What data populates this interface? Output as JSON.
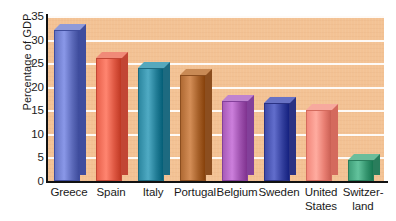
{
  "chart_data": {
    "type": "bar",
    "title": "",
    "xlabel": "",
    "ylabel": "Percentage of GDP",
    "ylim": [
      0,
      35
    ],
    "ytick_values": [
      0,
      5,
      10,
      15,
      20,
      25,
      30,
      35
    ],
    "ytick_labels": [
      "0",
      "5",
      "10",
      "15",
      "20",
      "25",
      "30",
      "35"
    ],
    "grid": "horizontal",
    "gridline_color": "#ffffff",
    "plot_background": "#f3c294",
    "legend": "none",
    "categories": [
      "Greece",
      "Spain",
      "Italy",
      "Portugal",
      "Belgium",
      "Sweden",
      "United States",
      "Switzerland"
    ],
    "category_label_lines": [
      [
        "Greece"
      ],
      [
        "Spain"
      ],
      [
        "Italy"
      ],
      [
        "Portugal"
      ],
      [
        "Belgium"
      ],
      [
        "Sweden"
      ],
      [
        "United",
        "States"
      ],
      [
        "Switzer-",
        "land"
      ]
    ],
    "values": [
      32,
      26,
      24,
      22.5,
      17,
      16.5,
      15,
      4.5
    ],
    "bar_colors": [
      "#6674c4",
      "#e8614c",
      "#2c87a0",
      "#b06a33",
      "#a85bb8",
      "#3e4aa8",
      "#f2887c",
      "#3f9f79"
    ],
    "bar_top_colors": [
      "#8f9ad9",
      "#f08a78",
      "#55a8bd",
      "#c98a55",
      "#c083cf",
      "#6872c4",
      "#f7a99e",
      "#6bbd9b"
    ],
    "bar_side_colors": [
      "#3f4d9e",
      "#c24634",
      "#1d6a80",
      "#8c4e1f",
      "#83409a",
      "#2a3283",
      "#d46a5d",
      "#2a7d5c"
    ]
  },
  "axes": {
    "y_title": "Percentage of GDP"
  }
}
